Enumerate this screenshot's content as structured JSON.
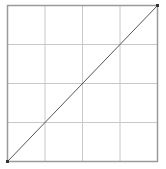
{
  "chart_data": {
    "type": "line",
    "title": "",
    "xlabel": "",
    "ylabel": "",
    "xlim": [
      0,
      1
    ],
    "ylim": [
      0,
      1
    ],
    "grid": true,
    "grid_divisions": 4,
    "legend": null,
    "series": [
      {
        "name": "diagonal",
        "x": [
          0,
          1
        ],
        "y": [
          0,
          1
        ],
        "color": "#555555"
      }
    ]
  },
  "colors": {
    "frame": "#9a9a9a",
    "grid": "#c8c8c8",
    "line": "#555555",
    "marker": "#333333"
  }
}
